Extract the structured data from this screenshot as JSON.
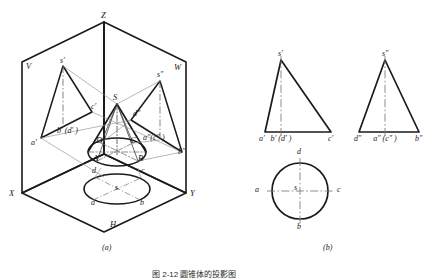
{
  "figure": {
    "title_caption": "图 2-12  圆锥体的投影图",
    "part_a_label": "(a)",
    "part_b_label": "(b)"
  },
  "part_a": {
    "name": "three-plane projection box with cone",
    "axes": [
      {
        "id": "Z",
        "label": "Z"
      },
      {
        "id": "X",
        "label": "X"
      },
      {
        "id": "Y",
        "label": "Y"
      }
    ],
    "planes": [
      {
        "id": "V",
        "label": "V"
      },
      {
        "id": "W",
        "label": "W"
      },
      {
        "id": "H",
        "label": "H"
      }
    ],
    "solid_labels": [
      {
        "id": "S",
        "label": "S"
      },
      {
        "id": "A",
        "label": "A"
      },
      {
        "id": "B",
        "label": "B"
      },
      {
        "id": "C",
        "label": "C"
      },
      {
        "id": "D",
        "label": "D"
      }
    ],
    "front_projection_labels": [
      {
        "id": "s1",
        "label": "s′"
      },
      {
        "id": "a1",
        "label": "a′"
      },
      {
        "id": "bd1",
        "label": "b′ (d′ )"
      },
      {
        "id": "c1",
        "label": "c′"
      }
    ],
    "side_projection_labels": [
      {
        "id": "s2",
        "label": "s″"
      },
      {
        "id": "d2",
        "label": "d″"
      },
      {
        "id": "ac2",
        "label": "a″(c″ )"
      },
      {
        "id": "b2",
        "label": "b″"
      }
    ],
    "top_projection_labels": [
      {
        "id": "s0",
        "label": "s"
      },
      {
        "id": "a0",
        "label": "a"
      },
      {
        "id": "b0",
        "label": "b"
      },
      {
        "id": "c0",
        "label": "c"
      },
      {
        "id": "d0",
        "label": "d"
      }
    ]
  },
  "part_b": {
    "name": "three orthographic views of the cone",
    "front_view": {
      "title": "front-view-triangle",
      "apex_label": "s′",
      "base_labels": [
        "a′",
        "b′ (d′ )",
        "c′"
      ]
    },
    "side_view": {
      "title": "side-view-triangle",
      "apex_label": "s″",
      "base_labels": [
        "d″",
        "a″ (c″ )",
        "b″"
      ]
    },
    "top_view": {
      "title": "top-view-circle",
      "center_label": "s",
      "point_labels": [
        "a",
        "b",
        "c",
        "d"
      ]
    }
  },
  "colors": {
    "ink": "#1a1a1a",
    "thin": "#555555",
    "centerline": "#777777",
    "paper": "#ffffff"
  }
}
